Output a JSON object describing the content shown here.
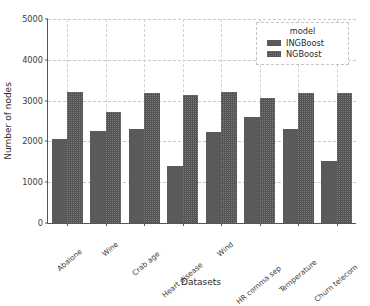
{
  "chart_data": {
    "type": "bar",
    "title": "",
    "xlabel": "Datasets",
    "ylabel": "Number of nodes",
    "categories": [
      "Abalone",
      "Wine",
      "Crab age",
      "Heart disease",
      "Wind",
      "HR comma sep",
      "Temperature",
      "Churn telecom"
    ],
    "series": [
      {
        "name": "INGBoost",
        "color": "#5a5a5a",
        "values": [
          2060,
          2255,
          2305,
          1395,
          2230,
          2600,
          2305,
          1520
        ]
      },
      {
        "name": "NGBoost",
        "color": "#555555",
        "values": [
          3210,
          2720,
          3185,
          3135,
          3210,
          3065,
          3195,
          3175
        ]
      }
    ],
    "ylim": [
      0,
      5000
    ],
    "yticks": [
      0,
      1000,
      2000,
      3000,
      4000,
      5000
    ],
    "ytick_labels": [
      "0",
      "1000",
      "2000",
      "3000",
      "4000",
      "5000"
    ],
    "grid": true,
    "grid_axis": "both",
    "legend": {
      "title": "model",
      "position": "upper right",
      "entries": [
        "INGBoost",
        "NGBoost"
      ]
    }
  }
}
